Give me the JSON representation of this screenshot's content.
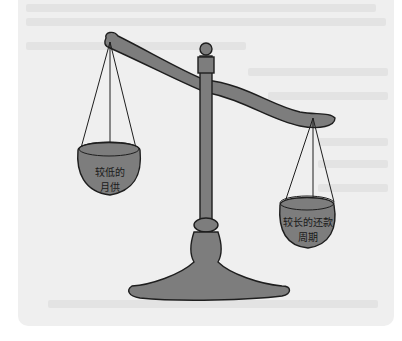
{
  "illustration": {
    "subject": "balance-scale",
    "left_pan": {
      "line1": "较低的",
      "line2": "月供"
    },
    "right_pan": {
      "line1": "较长的还款",
      "line2": "周期"
    }
  },
  "colors": {
    "background": "#efefef",
    "metal": "#7d7d7d",
    "outline": "#1e1e1e"
  }
}
